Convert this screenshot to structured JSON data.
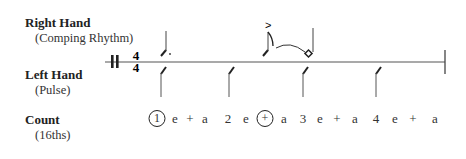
{
  "rows": {
    "right_hand": {
      "title": "Right Hand",
      "subtitle": "(Comping Rhythm)"
    },
    "left_hand": {
      "title": "Left Hand",
      "subtitle": "(Pulse)"
    },
    "count": {
      "title": "Count",
      "subtitle": "(16ths)"
    }
  },
  "time_signature": {
    "top": "4",
    "bottom": "4"
  },
  "accent_symbol": ">",
  "right_hand_notes": [
    {
      "beat_position": "1",
      "type": "dotted-eighth-slash"
    },
    {
      "beat_position": "+ of 2",
      "type": "sixteenth-slash",
      "accent": true,
      "tied": true
    },
    {
      "beat_position": "3",
      "type": "half-slash-diamond"
    }
  ],
  "left_hand_pulse": [
    "1",
    "2",
    "3",
    "4"
  ],
  "counts": [
    {
      "text": "1",
      "circled": true
    },
    {
      "text": "e",
      "circled": false
    },
    {
      "text": "+",
      "circled": false
    },
    {
      "text": "a",
      "circled": false
    },
    {
      "text": "2",
      "circled": false
    },
    {
      "text": "e",
      "circled": false
    },
    {
      "text": "+",
      "circled": true
    },
    {
      "text": "a",
      "circled": false
    },
    {
      "text": "3",
      "circled": false
    },
    {
      "text": "e",
      "circled": false
    },
    {
      "text": "+",
      "circled": false
    },
    {
      "text": "a",
      "circled": false
    },
    {
      "text": "4",
      "circled": false
    },
    {
      "text": "e",
      "circled": false
    },
    {
      "text": "+",
      "circled": false
    },
    {
      "text": "a",
      "circled": false
    }
  ]
}
